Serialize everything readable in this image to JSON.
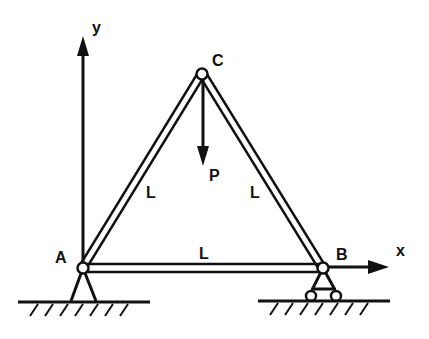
{
  "diagram": {
    "type": "truss",
    "nodes": {
      "A": {
        "label": "A",
        "x": 83,
        "y": 268,
        "support": "pin"
      },
      "B": {
        "label": "B",
        "x": 323,
        "y": 268,
        "support": "roller"
      },
      "C": {
        "label": "C",
        "x": 202,
        "y": 74,
        "support": "none"
      }
    },
    "members": [
      {
        "from": "A",
        "to": "C",
        "label": "L"
      },
      {
        "from": "C",
        "to": "B",
        "label": "L"
      },
      {
        "from": "A",
        "to": "B",
        "label": "L"
      }
    ],
    "load": {
      "label": "P",
      "at": "C",
      "direction": "down"
    },
    "axes": {
      "x_label": "x",
      "y_label": "y"
    },
    "colors": {
      "ink": "#111111",
      "background": "#ffffff"
    }
  }
}
